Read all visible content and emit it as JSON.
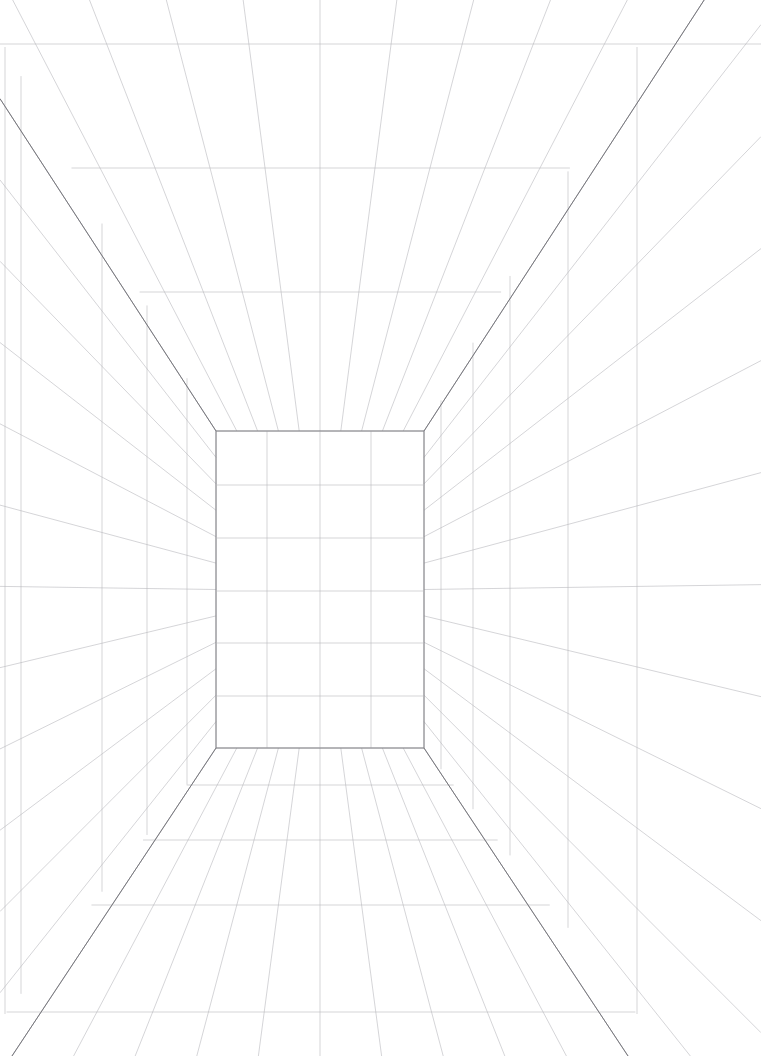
{
  "artboard": {
    "title": "One-Point Perspective Room Grid",
    "width": 761,
    "height": 1056,
    "background_color": "#ffffff"
  },
  "colors": {
    "background": "#ffffff",
    "grid_line": "#b9b9bd",
    "grid_line_faint": "#cfcfd4",
    "edge_line": "#8a8a90",
    "corner_edge": "#6e6e74"
  },
  "stroke_widths": {
    "grid_line": 0.6,
    "edge_line": 0.8,
    "corner_edge": 0.9
  },
  "chart_data": {
    "type": "line",
    "xlabel": "",
    "ylabel": "",
    "grid": true,
    "legend": "none",
    "xlim": [
      0,
      761
    ],
    "ylim": [
      0,
      1056
    ],
    "vanishing_point": {
      "x": 320,
      "y": 591
    },
    "back_wall": {
      "left": 216,
      "right": 424,
      "top": 431,
      "bottom": 748,
      "columns": 4,
      "rows": 6,
      "vertical_lines_x": [
        216,
        267,
        320,
        371,
        424
      ],
      "horizontal_lines_y": [
        431,
        485,
        538,
        591,
        643,
        696,
        748
      ]
    },
    "room_front_frame": {
      "left": 5,
      "right": 637,
      "top": 47,
      "bottom": 1014,
      "note": "front aperture of the room; corner diagonals run from this rectangle's corners to the back wall corners"
    },
    "ceiling": {
      "transverse_lines_y": [
        44,
        168,
        292,
        431
      ],
      "radiating_line_count": 11
    },
    "floor": {
      "transverse_lines_y": [
        748,
        785,
        840,
        905,
        1012
      ],
      "radiating_line_count": 11
    },
    "left_wall": {
      "vertical_lines_x": [
        5,
        21,
        102,
        147,
        187,
        216
      ],
      "radiating_line_count": 13
    },
    "right_wall": {
      "vertical_lines_x": [
        424,
        441,
        473,
        510,
        568,
        637
      ],
      "radiating_line_count": 13
    }
  }
}
